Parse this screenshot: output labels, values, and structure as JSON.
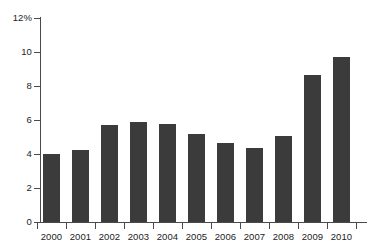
{
  "chart_data": {
    "type": "bar",
    "title": "",
    "subtitle": "",
    "xlabel": "",
    "ylabel": "",
    "categories": [
      "2000",
      "2001",
      "2002",
      "2003",
      "2004",
      "2005",
      "2006",
      "2007",
      "2008",
      "2009",
      "2010"
    ],
    "values": [
      4.0,
      4.25,
      5.7,
      5.9,
      5.75,
      5.2,
      4.65,
      4.35,
      5.05,
      8.65,
      9.7
    ],
    "series": [
      {
        "name": "",
        "values": [
          4.0,
          4.25,
          5.7,
          5.9,
          5.75,
          5.2,
          4.65,
          4.35,
          5.05,
          8.65,
          9.7
        ]
      }
    ],
    "ylim": [
      0,
      12
    ],
    "xlim_categories": 11,
    "ytick_values": [
      0,
      2,
      4,
      6,
      8,
      10,
      12
    ],
    "ytick_labels": [
      "0",
      "2",
      "4",
      "6",
      "8",
      "10",
      "12%"
    ],
    "unit": "%",
    "grid": false,
    "legend": null,
    "legend_position": "none",
    "annotations": [],
    "bar_color": "#3b3b3b",
    "axis_color": "#4a4a4a",
    "background_color": "#ffffff"
  }
}
